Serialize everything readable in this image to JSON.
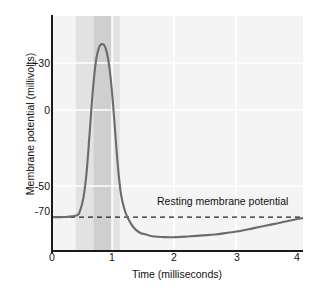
{
  "chart_data": {
    "type": "line",
    "title": "",
    "xlabel": "Time (milliseconds)",
    "ylabel": "Membrane potential (millivolts)",
    "xlim": [
      0,
      4
    ],
    "ylim": [
      -90,
      45
    ],
    "xticks": [
      "0",
      "1",
      "2",
      "3",
      "4"
    ],
    "xtick_values": [
      0,
      1,
      2,
      3,
      4
    ],
    "yticks": [
      "+30",
      "0",
      "-50",
      "-70"
    ],
    "ytick_values": [
      30,
      0,
      -50,
      -70
    ],
    "grid": true,
    "legend": "none",
    "annotations": [
      {
        "text": "Resting membrane potential",
        "value": -70,
        "style": "dashed-line-label"
      }
    ],
    "series": [
      {
        "name": "Action potential",
        "color": "#6b6b6b",
        "x": [
          0.0,
          0.2,
          0.4,
          0.45,
          0.5,
          0.55,
          0.6,
          0.65,
          0.7,
          0.75,
          0.8,
          0.85,
          0.9,
          0.95,
          1.0,
          1.05,
          1.1,
          1.15,
          1.2,
          1.3,
          1.4,
          1.5,
          1.6,
          1.8,
          2.0,
          2.2,
          2.4,
          2.6,
          2.8,
          3.0,
          3.2,
          3.4,
          3.6,
          3.8,
          4.0
        ],
        "y": [
          -70,
          -70,
          -69,
          -66,
          -59,
          -45,
          -22,
          2,
          19,
          27,
          29,
          27,
          19,
          4,
          -18,
          -41,
          -57,
          -65,
          -70,
          -76,
          -79,
          -80,
          -81,
          -81.5,
          -81.5,
          -81,
          -80.5,
          -80,
          -79,
          -78,
          -76.5,
          -75,
          -73.5,
          -72,
          -70.5
        ]
      }
    ],
    "shaded_bands": [
      {
        "name": "absolute-refractory-early",
        "x0": 0.38,
        "x1": 0.66,
        "color": "#e2e2e2"
      },
      {
        "name": "absolute-refractory-peak",
        "x0": 0.66,
        "x1": 0.96,
        "color": "#cfcfcf"
      },
      {
        "name": "relative-refractory",
        "x0": 0.98,
        "x1": 1.08,
        "color": "#e2e2e2"
      }
    ],
    "plot_background": "#f4f4f4",
    "gridline_color": "#ffffff",
    "axis_color": "#1a1a1a",
    "curve_color": "#6b6b6b",
    "resting_line_color": "#222222"
  }
}
